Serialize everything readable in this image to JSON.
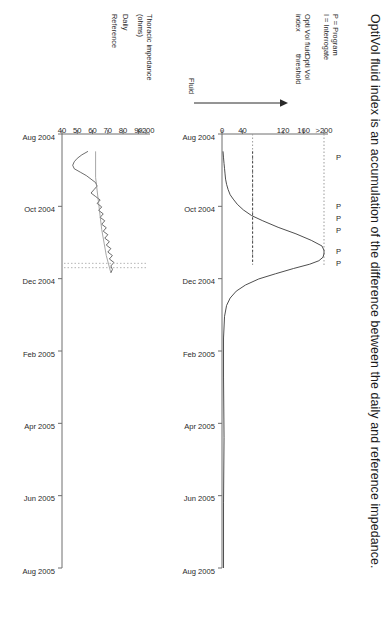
{
  "title": "OptiVol fluid index is an accumulation of the difference between the daily and reference impedance.",
  "legend": {
    "program_key": "P = Program",
    "interrogate_key": "I = Interrogate",
    "optivol_index_label": "Opti Vol fluid\nindex",
    "optivol_threshold_label": "Opti Vol\nthreshold",
    "fluid_axis_label": "Fluid",
    "thoracic_label": "Thoracic impedance\n(ohms)",
    "daily_label": "Daily",
    "reference_label": "Reference"
  },
  "program_markers": [
    {
      "label": "P",
      "x": 0.055
    },
    {
      "label": "P",
      "x": 0.168
    },
    {
      "label": "P",
      "x": 0.196
    },
    {
      "label": "P",
      "x": 0.224
    },
    {
      "label": "P",
      "x": 0.272
    },
    {
      "label": "P",
      "x": 0.3
    }
  ],
  "chart_data": [
    {
      "type": "line",
      "name": "optivol-fluid-index",
      "title": "OptiVol fluid index",
      "ylabel": "Fluid",
      "xlabel": "",
      "grid": false,
      "legend_position": "left",
      "ylim": [
        0,
        200
      ],
      "yticks": [
        0,
        40,
        120,
        160,
        200
      ],
      "ytick_labels": [
        "0",
        "40",
        "120",
        "160",
        ">200"
      ],
      "xticks": [
        "Aug 2004",
        "Oct 2004",
        "Dec 2004",
        "Feb 2005",
        "Apr 2005",
        "Jun 2005",
        "Aug 2005"
      ],
      "threshold": 60,
      "series": [
        {
          "name": "OptiVol fluid index",
          "style": "solid",
          "x": [
            0.04,
            0.055,
            0.068,
            0.08,
            0.092,
            0.104,
            0.116,
            0.128,
            0.14,
            0.15,
            0.162,
            0.175,
            0.188,
            0.2,
            0.215,
            0.23,
            0.245,
            0.258,
            0.268,
            0.276,
            0.284,
            0.292,
            0.3,
            0.31,
            0.322,
            0.334,
            0.348,
            0.362,
            0.378,
            0.395,
            0.42,
            0.47,
            0.56,
            0.7,
            0.85,
            1.0
          ],
          "y": [
            2,
            3,
            4,
            5,
            6,
            7,
            9,
            12,
            16,
            22,
            30,
            42,
            58,
            80,
            110,
            145,
            175,
            196,
            200,
            200,
            198,
            190,
            172,
            140,
            105,
            72,
            46,
            28,
            16,
            9,
            5,
            3,
            3,
            4,
            3,
            3
          ]
        },
        {
          "name": "OptiVol threshold",
          "style": "dashed",
          "x": [
            0.04,
            0.3
          ],
          "y": [
            60,
            60
          ]
        }
      ]
    },
    {
      "type": "line",
      "name": "thoracic-impedance",
      "title": "Thoracic impedance (ohms)",
      "ylabel": "Thoracic impedance (ohms)",
      "xlabel": "",
      "grid": false,
      "legend_position": "left",
      "ylim": [
        40,
        200
      ],
      "yticks": [
        40,
        50,
        60,
        70,
        80,
        90,
        200
      ],
      "ytick_labels": [
        "40",
        "50",
        "60",
        "70",
        "80",
        "90",
        ">200"
      ],
      "xticks": [
        "Aug 2004",
        "Oct 2004",
        "Dec 2004",
        "Feb 2005",
        "Apr 2005",
        "Jun 2005",
        "Aug 2005"
      ],
      "series": [
        {
          "name": "Daily",
          "style": "solid-thin",
          "x": [
            0.04,
            0.048,
            0.056,
            0.064,
            0.072,
            0.08,
            0.088,
            0.096,
            0.104,
            0.112,
            0.12,
            0.128,
            0.136,
            0.144,
            0.152,
            0.16,
            0.168,
            0.176,
            0.184,
            0.192,
            0.2,
            0.208,
            0.216,
            0.224,
            0.232,
            0.24,
            0.248,
            0.256,
            0.264,
            0.272,
            0.28,
            0.288,
            0.296,
            0.304,
            0.312,
            0.32
          ],
          "y": [
            57,
            53,
            50,
            48,
            47,
            48,
            52,
            56,
            59,
            62,
            63,
            61,
            59,
            62,
            65,
            63,
            66,
            64,
            67,
            65,
            68,
            66,
            69,
            67,
            70,
            68,
            71,
            69,
            72,
            70,
            73,
            71,
            74,
            72,
            73,
            72
          ]
        },
        {
          "name": "Reference",
          "style": "solid-grey",
          "x": [
            0.04,
            0.1,
            0.16,
            0.22,
            0.28,
            0.32
          ],
          "y": [
            62,
            62,
            64,
            66,
            69,
            72
          ]
        }
      ]
    }
  ]
}
